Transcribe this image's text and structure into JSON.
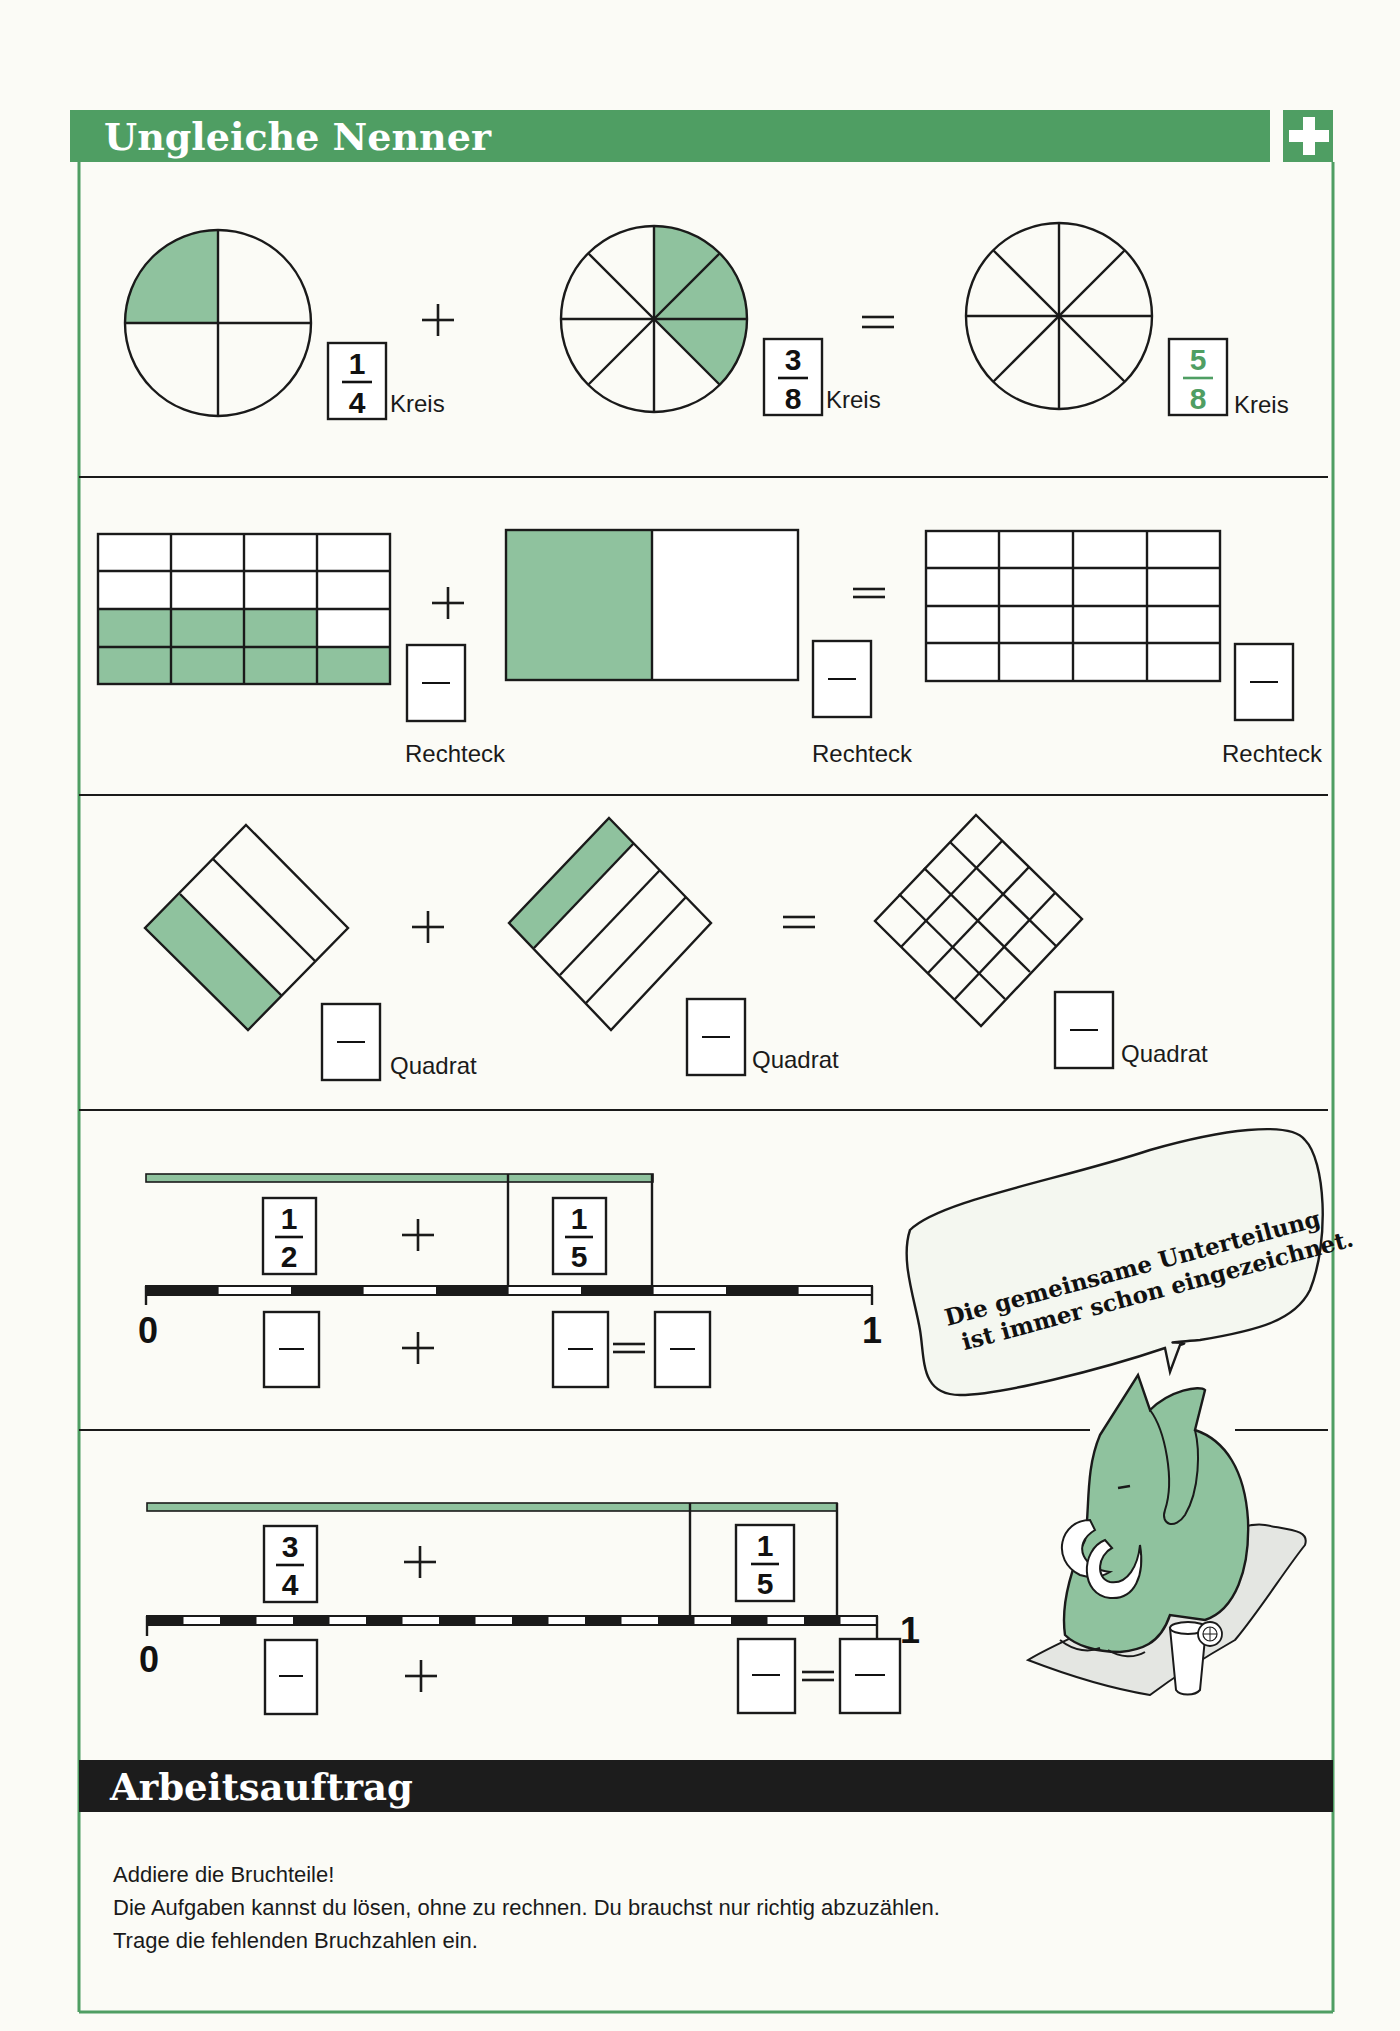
{
  "header": {
    "title": "Ungleiche Nenner",
    "badge_symbol": "+",
    "accent_color": "#4f9e63",
    "fill_color": "#8fc29e"
  },
  "row1_circles": {
    "items": [
      {
        "shape": "circle",
        "divisions": 4,
        "shaded": 1,
        "fraction": {
          "numerator": "1",
          "denominator": "4"
        },
        "label": "Kreis"
      },
      {
        "shape": "circle",
        "divisions": 8,
        "shaded": 3,
        "fraction": {
          "numerator": "3",
          "denominator": "8"
        },
        "label": "Kreis"
      },
      {
        "shape": "circle",
        "divisions": 8,
        "shaded": 0,
        "fraction": {
          "numerator": "5",
          "denominator": "8"
        },
        "label": "Kreis",
        "fraction_color": "#4f9e63"
      }
    ],
    "operators": [
      "+",
      "="
    ]
  },
  "row2_rectangles": {
    "items": [
      {
        "shape": "rectangle",
        "grid": "4x4",
        "shaded": 7,
        "fraction": {
          "numerator": "",
          "denominator": ""
        },
        "label": "Rechteck"
      },
      {
        "shape": "rectangle",
        "grid": "2x1",
        "shaded": 1,
        "fraction": {
          "numerator": "",
          "denominator": ""
        },
        "label": "Rechteck"
      },
      {
        "shape": "rectangle",
        "grid": "4x4",
        "shaded": 0,
        "fraction": {
          "numerator": "",
          "denominator": ""
        },
        "label": "Rechteck"
      }
    ],
    "operators": [
      "+",
      "="
    ]
  },
  "row3_squares": {
    "items": [
      {
        "shape": "square",
        "strips": 3,
        "shaded": 1,
        "fraction": {
          "numerator": "",
          "denominator": ""
        },
        "label": "Quadrat"
      },
      {
        "shape": "square",
        "strips": 4,
        "shaded": 1,
        "fraction": {
          "numerator": "",
          "denominator": ""
        },
        "label": "Quadrat"
      },
      {
        "shape": "square",
        "grid": "4x4",
        "shaded": 0,
        "fraction": {
          "numerator": "",
          "denominator": ""
        },
        "label": "Quadrat"
      }
    ],
    "operators": [
      "+",
      "="
    ]
  },
  "row4_numberline": {
    "fractions": [
      {
        "numerator": "1",
        "denominator": "2"
      },
      {
        "numerator": "1",
        "denominator": "5"
      }
    ],
    "segments": 10,
    "start_label": "0",
    "end_label": "1",
    "operators": [
      "+",
      "+",
      "="
    ]
  },
  "row5_numberline": {
    "fractions": [
      {
        "numerator": "3",
        "denominator": "4"
      },
      {
        "numerator": "1",
        "denominator": "5"
      }
    ],
    "segments": 20,
    "start_label": "0",
    "end_label": "1",
    "operators": [
      "+",
      "+",
      "="
    ]
  },
  "speech_bubble": {
    "line1": "Die gemeinsame Unterteilung",
    "line2": "ist immer schon eingezeichnet."
  },
  "mascot": {
    "icon": "mammoth-icon"
  },
  "assignment": {
    "title": "Arbeitsauftrag",
    "lines": [
      "Addiere die Bruchteile!",
      "Die Aufgaben kannst du lösen, ohne zu rechnen. Du brauchst nur richtig abzuzählen.",
      "Trage die fehlenden Bruchzahlen ein."
    ]
  }
}
